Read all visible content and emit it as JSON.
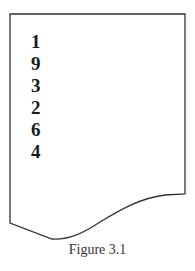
{
  "figure": {
    "caption": "Figure 3.1",
    "shape": "document-page-with-wavy-bottom",
    "stroke_color": "#333333"
  },
  "list": {
    "items": [
      "1",
      "9",
      "3",
      "2",
      "6",
      "4"
    ]
  }
}
